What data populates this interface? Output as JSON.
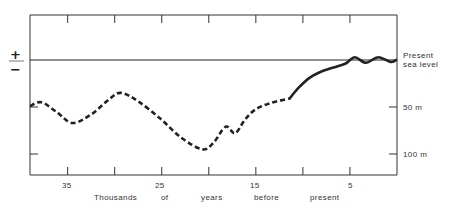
{
  "chart_data": {
    "type": "line",
    "title": "",
    "xlabel": "Thousands of years before present",
    "xlabel_words": [
      "Thousands",
      "of",
      "years",
      "before",
      "present"
    ],
    "ylabel": "",
    "x_reversed": true,
    "xlim": [
      39,
      0
    ],
    "ylim": [
      -110,
      12
    ],
    "x_tick_labels": [
      "35",
      "25",
      "15",
      "5"
    ],
    "x_ticks": [
      35,
      30,
      25,
      20,
      15,
      10,
      5
    ],
    "y_tick_labels": [
      "50 m",
      "100 m"
    ],
    "y_ticks": [
      -50,
      -100
    ],
    "reference_line": {
      "label_line1": "Present",
      "label_line2": "sea level",
      "value": 0
    },
    "sign_labels": {
      "plus": "+",
      "minus": "−"
    },
    "grid": false,
    "series": [
      {
        "name": "Sea level (estimated, dashed)",
        "style": "dashed",
        "x": [
          39.0,
          37.8,
          36.2,
          34.5,
          32.5,
          30.5,
          29.3,
          27.5,
          25.2,
          23.0,
          20.7,
          19.5,
          18.2,
          17.2,
          16.2,
          15.1,
          13.5,
          11.4
        ],
        "y": [
          -49,
          -45,
          -55,
          -67,
          -58,
          -41,
          -35,
          -44,
          -62,
          -82,
          -95,
          -88,
          -71,
          -78,
          -64,
          -53,
          -46,
          -41
        ]
      },
      {
        "name": "Sea level (well established, solid)",
        "style": "solid",
        "x": [
          11.4,
          10.5,
          9.3,
          8.2,
          7.1,
          5.5,
          4.5,
          3.3,
          2.0,
          0.7,
          0.1
        ],
        "y": [
          -41,
          -30,
          -19,
          -13,
          -9,
          -4,
          3,
          -3,
          3,
          -2,
          0
        ]
      }
    ]
  }
}
